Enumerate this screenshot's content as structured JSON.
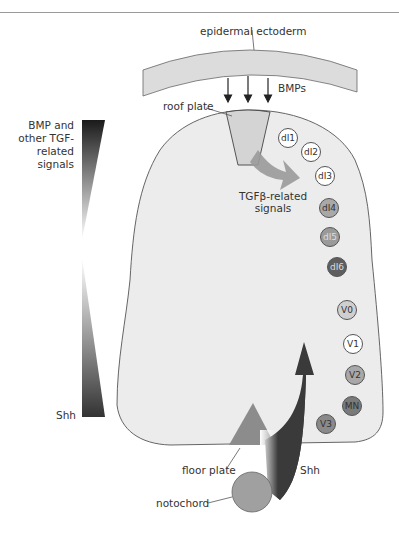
{
  "labels": {
    "epidermal_ectoderm": "epidermal ectoderm",
    "bmps": "BMPs",
    "roof_plate": "roof plate",
    "bmp_gradient": "BMP and\nother TGF-\nrelated\nsignals",
    "bmp_line1": "BMP and",
    "bmp_line2": "other TGF-",
    "bmp_line3": "related",
    "bmp_line4": "signals",
    "shh_gradient": "Shh",
    "tgfb_line1": "TGFβ-related",
    "tgfb_line2": "signals",
    "floor_plate": "floor plate",
    "shh_arrow": "Shh",
    "notochord": "notochord"
  },
  "cells": [
    {
      "id": "dI1",
      "label": "dI1",
      "fill": "#ffffff",
      "text": "#333333"
    },
    {
      "id": "dI2",
      "label": "dI2",
      "fill": "#ffffff",
      "text": "#333333"
    },
    {
      "id": "dI3",
      "label": "dI3",
      "fill": "#ffffff",
      "text": "#333333"
    },
    {
      "id": "dI4",
      "label": "dI4",
      "fill": "#a8a8a8",
      "text": "#333333"
    },
    {
      "id": "dI5",
      "label": "dI5",
      "fill": "#9a9a9a",
      "text": "#dddddd"
    },
    {
      "id": "dI6",
      "label": "dI6",
      "fill": "#5e5e5e",
      "text": "#dddddd"
    },
    {
      "id": "V0",
      "label": "V0",
      "fill": "#cfcfcf",
      "text": "#333333"
    },
    {
      "id": "V1",
      "label": "V1",
      "fill": "#ffffff",
      "text": "#333333"
    },
    {
      "id": "V2",
      "label": "V2",
      "fill": "#a8a8a8",
      "text": "#333333"
    },
    {
      "id": "MN",
      "label": "MN",
      "fill": "#7a7a7a",
      "text": "#333333"
    },
    {
      "id": "V3",
      "label": "V3",
      "fill": "#8a8a8a",
      "text": "#333333"
    }
  ],
  "colors": {
    "tube_fill": "#ececec",
    "ectoderm_fill": "#dcdcdc",
    "roof_plate_fill": "#d4d4d4",
    "floor_plate_fill": "#8c8c8c",
    "notochord_fill": "#a0a0a0",
    "shh_arrow": "#3a3a3a",
    "tgfb_arrow": "#9a9a9a"
  }
}
